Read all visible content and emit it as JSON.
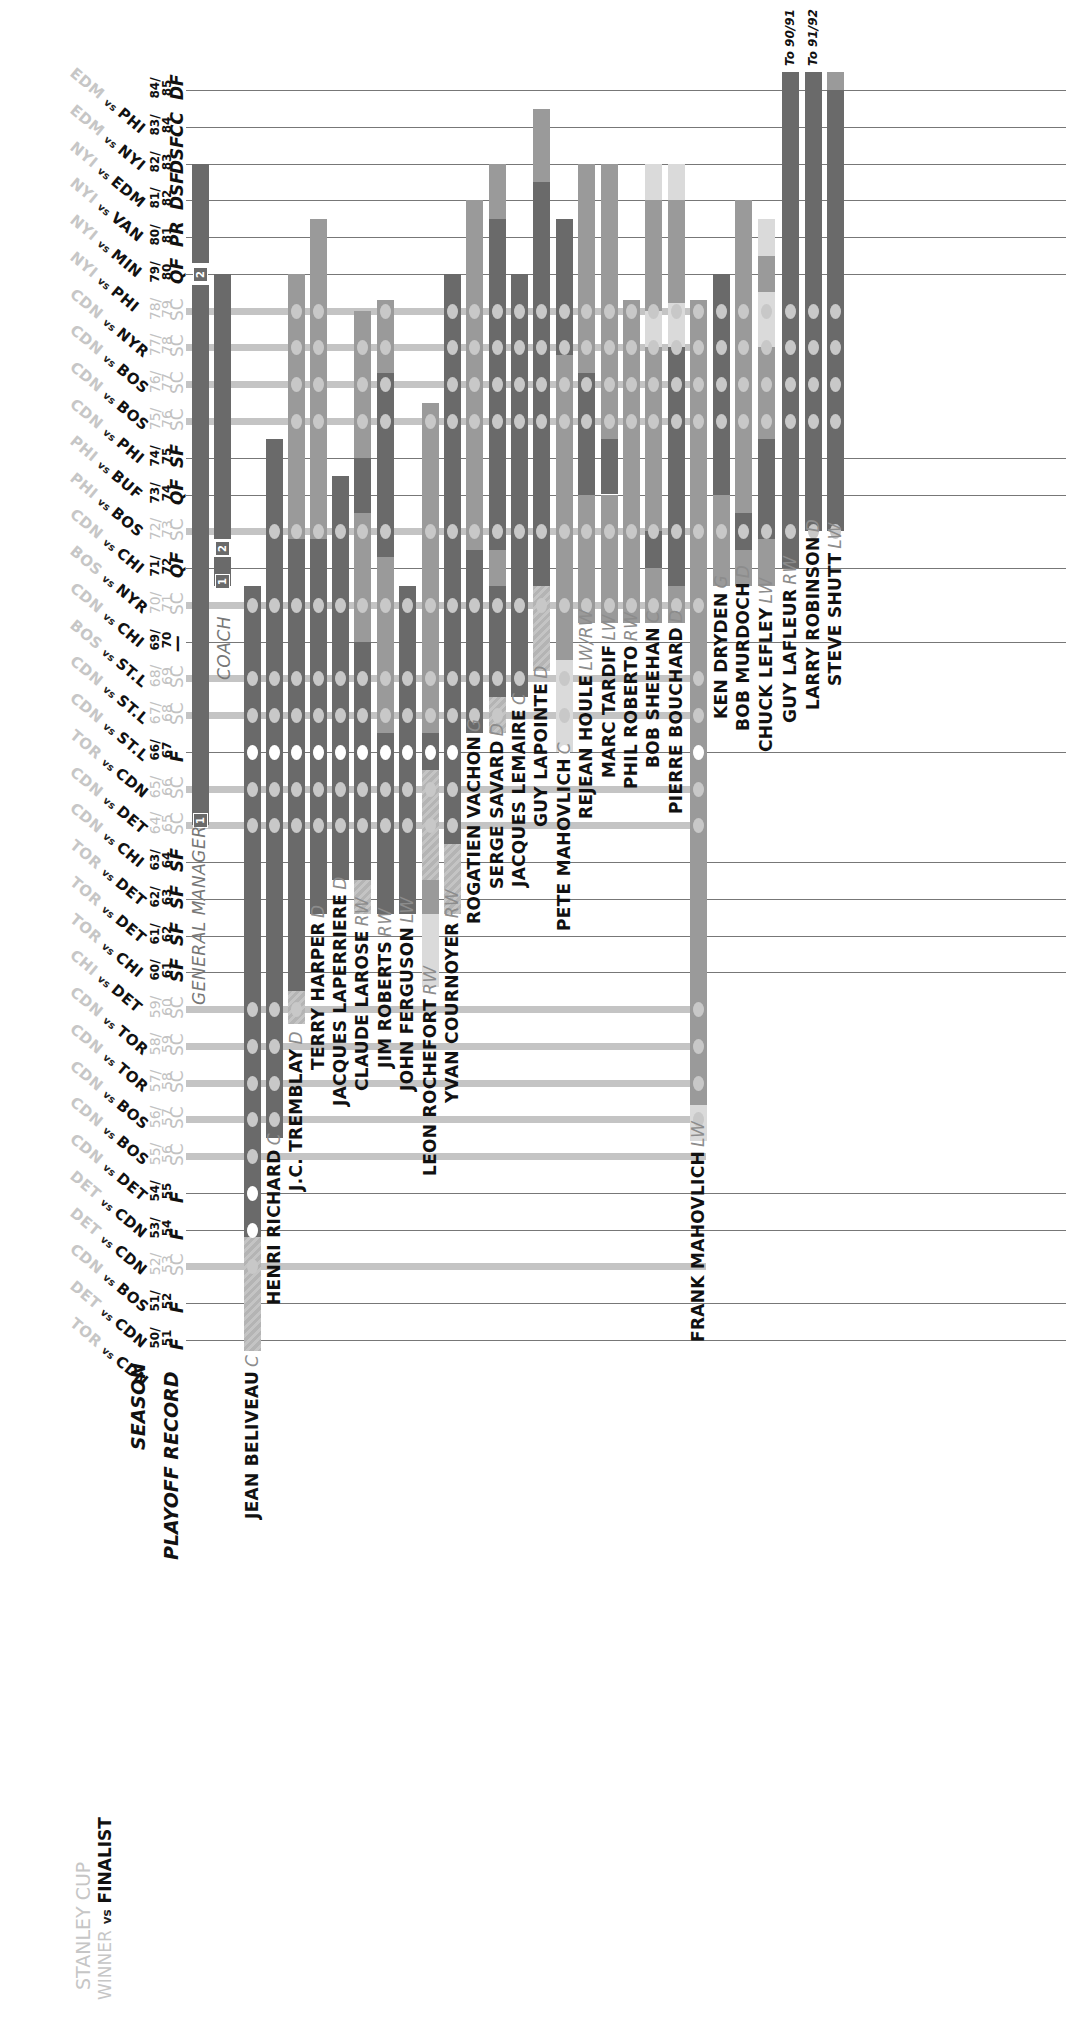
{
  "header": {
    "stanley_cup_label": "STANLEY CUP",
    "winner_label": "WINNER",
    "vs_label": "vs",
    "finalist_label": "FINALIST",
    "season_label": "SEASON",
    "playoff_record_label": "PLAYOFF RECORD"
  },
  "roles": {
    "general_manager_label": "GENERAL MANAGER",
    "coach_label": "COACH",
    "gm_term_markers": [
      "1",
      "2"
    ],
    "coach_term_markers": [
      "1",
      "2"
    ]
  },
  "colors": {
    "dark_bar": "#6a6a6a",
    "mid_bar": "#9a9a9a",
    "light_bar": "#b9b9b9",
    "pale_bar": "#dadada",
    "cup_row": "#c4c4c4",
    "winner_text": "#c6c6c6",
    "cup_win_dot": "#ffffff",
    "cup_dot": "#c8c8c8"
  },
  "chart_data": {
    "type": "table",
    "orientation": "rotated 90deg: seasons are rows (84/85 top to 50/51 bottom), people are vertical bars",
    "seasons": [
      {
        "season": "50/51",
        "record": "F",
        "final": {
          "winner": "TOR",
          "finalist": "CDN"
        }
      },
      {
        "season": "51/52",
        "record": "F",
        "final": {
          "winner": "DET",
          "finalist": "CDN"
        }
      },
      {
        "season": "52/53",
        "record": "SC",
        "final": {
          "winner": "CDN",
          "finalist": "BOS"
        }
      },
      {
        "season": "53/54",
        "record": "F",
        "final": {
          "winner": "DET",
          "finalist": "CDN"
        }
      },
      {
        "season": "54/55",
        "record": "F",
        "final": {
          "winner": "DET",
          "finalist": "CDN"
        }
      },
      {
        "season": "55/56",
        "record": "SC",
        "final": {
          "winner": "CDN",
          "finalist": "DET"
        }
      },
      {
        "season": "56/57",
        "record": "SC",
        "final": {
          "winner": "CDN",
          "finalist": "BOS"
        }
      },
      {
        "season": "57/58",
        "record": "SC",
        "final": {
          "winner": "CDN",
          "finalist": "BOS"
        }
      },
      {
        "season": "58/59",
        "record": "SC",
        "final": {
          "winner": "CDN",
          "finalist": "TOR"
        }
      },
      {
        "season": "59/60",
        "record": "SC",
        "final": {
          "winner": "CDN",
          "finalist": "TOR"
        }
      },
      {
        "season": "60/61",
        "record": "SF",
        "final": {
          "winner": "CHI",
          "finalist": "DET"
        }
      },
      {
        "season": "61/62",
        "record": "SF",
        "final": {
          "winner": "TOR",
          "finalist": "CHI"
        }
      },
      {
        "season": "62/63",
        "record": "SF",
        "final": {
          "winner": "TOR",
          "finalist": "DET"
        }
      },
      {
        "season": "63/64",
        "record": "SF",
        "final": {
          "winner": "TOR",
          "finalist": "DET"
        }
      },
      {
        "season": "64/65",
        "record": "SC",
        "final": {
          "winner": "CDN",
          "finalist": "CHI"
        }
      },
      {
        "season": "65/66",
        "record": "SC",
        "final": {
          "winner": "CDN",
          "finalist": "DET"
        }
      },
      {
        "season": "66/67",
        "record": "F",
        "final": {
          "winner": "TOR",
          "finalist": "CDN"
        }
      },
      {
        "season": "67/68",
        "record": "SC",
        "final": {
          "winner": "CDN",
          "finalist": "ST.L"
        }
      },
      {
        "season": "68/69",
        "record": "SC",
        "final": {
          "winner": "CDN",
          "finalist": "ST.L"
        }
      },
      {
        "season": "69/70",
        "record": "—",
        "final": {
          "winner": "BOS",
          "finalist": "ST.L"
        }
      },
      {
        "season": "70/71",
        "record": "SC",
        "final": {
          "winner": "CDN",
          "finalist": "CHI"
        }
      },
      {
        "season": "71/72",
        "record": "QF",
        "final": {
          "winner": "BOS",
          "finalist": "NYR"
        }
      },
      {
        "season": "72/73",
        "record": "SC",
        "final": {
          "winner": "CDN",
          "finalist": "CHI"
        }
      },
      {
        "season": "73/74",
        "record": "QF",
        "final": {
          "winner": "PHI",
          "finalist": "BOS"
        }
      },
      {
        "season": "74/75",
        "record": "SF",
        "final": {
          "winner": "PHI",
          "finalist": "BUF"
        }
      },
      {
        "season": "75/76",
        "record": "SC",
        "final": {
          "winner": "CDN",
          "finalist": "PHI"
        }
      },
      {
        "season": "76/77",
        "record": "SC",
        "final": {
          "winner": "CDN",
          "finalist": "BOS"
        }
      },
      {
        "season": "77/78",
        "record": "SC",
        "final": {
          "winner": "CDN",
          "finalist": "BOS"
        }
      },
      {
        "season": "78/79",
        "record": "SC",
        "final": {
          "winner": "CDN",
          "finalist": "NYR"
        }
      },
      {
        "season": "79/80",
        "record": "QF",
        "final": {
          "winner": "NYI",
          "finalist": "PHI"
        }
      },
      {
        "season": "80/81",
        "record": "PR",
        "final": {
          "winner": "NYI",
          "finalist": "MIN"
        }
      },
      {
        "season": "81/82",
        "record": "DSF",
        "final": {
          "winner": "NYI",
          "finalist": "VAN"
        }
      },
      {
        "season": "82/83",
        "record": "DSF",
        "final": {
          "winner": "NYI",
          "finalist": "EDM"
        }
      },
      {
        "season": "83/84",
        "record": "CC",
        "final": {
          "winner": "EDM",
          "finalist": "NYI"
        }
      },
      {
        "season": "84/85",
        "record": "DF",
        "final": {
          "winner": "EDM",
          "finalist": "PHI"
        }
      }
    ],
    "people": [
      {
        "name": "GENERAL MANAGER",
        "pos": "",
        "kind": "role",
        "x": 200,
        "segments": [
          {
            "from": 14,
            "to": 28.7,
            "shade": "dark"
          },
          {
            "from": 29.3,
            "to": 32,
            "shade": "dark"
          }
        ]
      },
      {
        "name": "COACH",
        "pos": "",
        "kind": "role",
        "x": 222,
        "segments": [
          {
            "from": 20.5,
            "to": 21.3,
            "shade": "dark"
          },
          {
            "from": 21.8,
            "to": 29,
            "shade": "dark"
          }
        ]
      },
      {
        "name": "JEAN BELIVEAU",
        "pos": "C",
        "x": 252,
        "segments": [
          {
            "from": -0.3,
            "to": 2.8,
            "shade": "hatch"
          },
          {
            "from": 2.8,
            "to": 20.5,
            "shade": "dark"
          }
        ]
      },
      {
        "name": "HENRI RICHARD",
        "pos": "C",
        "x": 274,
        "segments": [
          {
            "from": 5.5,
            "to": 24.5,
            "shade": "dark"
          }
        ]
      },
      {
        "name": "J.C. TREMBLAY",
        "pos": "D",
        "x": 296,
        "segments": [
          {
            "from": 8.6,
            "to": 9.5,
            "shade": "hatch"
          },
          {
            "from": 9.5,
            "to": 21.8,
            "shade": "dark"
          },
          {
            "from": 21.8,
            "to": 29,
            "shade": "mid"
          }
        ]
      },
      {
        "name": "TERRY HARPER",
        "pos": "D",
        "x": 318,
        "segments": [
          {
            "from": 11.6,
            "to": 21.8,
            "shade": "dark"
          },
          {
            "from": 21.8,
            "to": 30.5,
            "shade": "mid"
          }
        ]
      },
      {
        "name": "JACQUES LAPERRIERE",
        "pos": "D",
        "x": 340,
        "segments": [
          {
            "from": 12.5,
            "to": 23.5,
            "shade": "dark"
          }
        ]
      },
      {
        "name": "CLAUDE LAROSE",
        "pos": "RW",
        "x": 362,
        "segments": [
          {
            "from": 11.6,
            "to": 12.5,
            "shade": "hatch"
          },
          {
            "from": 12.5,
            "to": 19,
            "shade": "dark"
          },
          {
            "from": 19,
            "to": 22.5,
            "shade": "mid"
          },
          {
            "from": 22.5,
            "to": 24,
            "shade": "dark"
          },
          {
            "from": 24,
            "to": 28,
            "shade": "mid"
          }
        ]
      },
      {
        "name": "JIM ROBERTS",
        "pos": "RW",
        "x": 385,
        "segments": [
          {
            "from": 11.6,
            "to": 16.5,
            "shade": "dark"
          },
          {
            "from": 16.5,
            "to": 21.3,
            "shade": "mid"
          },
          {
            "from": 21.3,
            "to": 26.3,
            "shade": "dark"
          },
          {
            "from": 26.3,
            "to": 28.3,
            "shade": "mid"
          }
        ]
      },
      {
        "name": "JOHN FERGUSON",
        "pos": "LW",
        "x": 407,
        "segments": [
          {
            "from": 11.6,
            "to": 20.5,
            "shade": "dark"
          }
        ]
      },
      {
        "name": "LEON ROCHEFORT",
        "pos": "RW",
        "x": 430,
        "segments": [
          {
            "from": 9.6,
            "to": 11.6,
            "shade": "pale"
          },
          {
            "from": 11.6,
            "to": 12.5,
            "shade": "mid"
          },
          {
            "from": 12.5,
            "to": 15.5,
            "shade": "hatch"
          },
          {
            "from": 15.5,
            "to": 16.5,
            "shade": "dark"
          },
          {
            "from": 16.5,
            "to": 20.5,
            "shade": "mid"
          },
          {
            "from": 20.5,
            "to": 25.5,
            "shade": "mid"
          }
        ]
      },
      {
        "name": "YVAN COURNOYER",
        "pos": "RW",
        "x": 452,
        "segments": [
          {
            "from": 11.6,
            "to": 13.5,
            "shade": "hatch"
          },
          {
            "from": 13.5,
            "to": 29,
            "shade": "dark"
          }
        ]
      },
      {
        "name": "ROGATIEN VACHON",
        "pos": "G",
        "x": 474,
        "segments": [
          {
            "from": 16.5,
            "to": 21.5,
            "shade": "dark"
          },
          {
            "from": 21.5,
            "to": 31,
            "shade": "mid"
          }
        ]
      },
      {
        "name": "SERGE SAVARD",
        "pos": "D",
        "x": 497,
        "segments": [
          {
            "from": 16.5,
            "to": 17.5,
            "shade": "hatch"
          },
          {
            "from": 17.5,
            "to": 20.5,
            "shade": "dark"
          },
          {
            "from": 20.5,
            "to": 21.5,
            "shade": "mid"
          },
          {
            "from": 21.5,
            "to": 30.5,
            "shade": "dark"
          },
          {
            "from": 30.5,
            "to": 32,
            "shade": "mid"
          }
        ]
      },
      {
        "name": "JACQUES LEMAIRE",
        "pos": "C",
        "x": 519,
        "segments": [
          {
            "from": 17.5,
            "to": 29,
            "shade": "dark"
          }
        ]
      },
      {
        "name": "GUY LAPOINTE",
        "pos": "D",
        "x": 541,
        "segments": [
          {
            "from": 18.2,
            "to": 20.5,
            "shade": "hatch"
          },
          {
            "from": 20.5,
            "to": 31.5,
            "shade": "dark"
          },
          {
            "from": 31.5,
            "to": 33.5,
            "shade": "mid"
          }
        ]
      },
      {
        "name": "PETE MAHOVLICH",
        "pos": "C",
        "x": 564,
        "segments": [
          {
            "from": 16,
            "to": 18.5,
            "shade": "pale"
          },
          {
            "from": 18.5,
            "to": 26.8,
            "shade": "mid"
          },
          {
            "from": 26.8,
            "to": 30.5,
            "shade": "dark"
          }
        ]
      },
      {
        "name": "REJEAN HOULE",
        "pos": "LW/RW",
        "x": 586,
        "segments": [
          {
            "from": 19.5,
            "to": 23,
            "shade": "mid"
          },
          {
            "from": 23,
            "to": 26.3,
            "shade": "dark"
          },
          {
            "from": 26.3,
            "to": 32,
            "shade": "mid"
          }
        ]
      },
      {
        "name": "MARC TARDIF",
        "pos": "LW",
        "x": 609,
        "segments": [
          {
            "from": 19.5,
            "to": 23,
            "shade": "mid"
          },
          {
            "from": 23,
            "to": 24.5,
            "shade": "dark"
          },
          {
            "from": 24.5,
            "to": 32,
            "shade": "mid"
          }
        ]
      },
      {
        "name": "PHIL ROBERTO",
        "pos": "RW",
        "x": 631,
        "segments": [
          {
            "from": 19.5,
            "to": 22.5,
            "shade": "mid"
          },
          {
            "from": 22.5,
            "to": 28.3,
            "shade": "mid"
          }
        ]
      },
      {
        "name": "BOB SHEEHAN",
        "pos": "C",
        "x": 653,
        "segments": [
          {
            "from": 19.5,
            "to": 21,
            "shade": "mid"
          },
          {
            "from": 21,
            "to": 22,
            "shade": "dark"
          },
          {
            "from": 22,
            "to": 27,
            "shade": "mid"
          },
          {
            "from": 27,
            "to": 28,
            "shade": "pale"
          },
          {
            "from": 28,
            "to": 31,
            "shade": "mid"
          },
          {
            "from": 31,
            "to": 32,
            "shade": "pale"
          }
        ]
      },
      {
        "name": "PIERRE BOUCHARD",
        "pos": "D",
        "x": 676,
        "segments": [
          {
            "from": 19.5,
            "to": 20.5,
            "shade": "mid"
          },
          {
            "from": 20.5,
            "to": 27,
            "shade": "dark"
          },
          {
            "from": 27,
            "to": 28.2,
            "shade": "pale"
          },
          {
            "from": 28.2,
            "to": 31,
            "shade": "mid"
          },
          {
            "from": 31,
            "to": 32,
            "shade": "pale"
          }
        ]
      },
      {
        "name": "FRANK MAHOVLICH",
        "pos": "LW",
        "x": 698,
        "segments": [
          {
            "from": 5.4,
            "to": 6.4,
            "shade": "pale"
          },
          {
            "from": 6.4,
            "to": 28.3,
            "shade": "mid"
          }
        ]
      },
      {
        "name": "KEN DRYDEN",
        "pos": "G",
        "x": 721,
        "segments": [
          {
            "from": 20.5,
            "to": 22,
            "shade": "mid"
          },
          {
            "from": 22,
            "to": 23,
            "shade": "mid"
          },
          {
            "from": 23,
            "to": 29,
            "shade": "dark"
          }
        ]
      },
      {
        "name": "BOB MURDOCH",
        "pos": "D",
        "x": 743,
        "segments": [
          {
            "from": 20.5,
            "to": 21.5,
            "shade": "mid"
          },
          {
            "from": 21.5,
            "to": 22.5,
            "shade": "dark"
          },
          {
            "from": 22.5,
            "to": 31,
            "shade": "mid"
          }
        ]
      },
      {
        "name": "CHUCK LEFLEY",
        "pos": "LW",
        "x": 766,
        "segments": [
          {
            "from": 20.5,
            "to": 21.8,
            "shade": "mid"
          },
          {
            "from": 21.8,
            "to": 24.5,
            "shade": "dark"
          },
          {
            "from": 24.5,
            "to": 27,
            "shade": "mid"
          },
          {
            "from": 27,
            "to": 28.5,
            "shade": "pale"
          },
          {
            "from": 28.5,
            "to": 29.5,
            "shade": "mid"
          },
          {
            "from": 29.5,
            "to": 30.5,
            "shade": "pale"
          }
        ]
      },
      {
        "name": "GUY LAFLEUR",
        "pos": "RW",
        "x": 790,
        "note": "To 90/91",
        "segments": [
          {
            "from": 21,
            "to": 34.5,
            "shade": "dark"
          }
        ]
      },
      {
        "name": "LARRY ROBINSON",
        "pos": "D",
        "x": 813,
        "note": "To 91/92",
        "segments": [
          {
            "from": 22,
            "to": 34.5,
            "shade": "dark"
          }
        ]
      },
      {
        "name": "STEVE SHUTT",
        "pos": "LW",
        "x": 835,
        "segments": [
          {
            "from": 22,
            "to": 34,
            "shade": "dark"
          },
          {
            "from": 34,
            "to": 34.5,
            "shade": "mid"
          }
        ]
      }
    ],
    "legend": {
      "white_dot": "Stanley Cup final lost / CDN finalist",
      "grey_dot": "Stanley Cup won"
    }
  }
}
